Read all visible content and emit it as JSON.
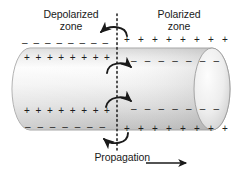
{
  "diagram": {
    "labels": {
      "depolarized_zone": "Depolarized\nzone",
      "polarized_zone": "Polarized\nzone",
      "propagation": "Propagation"
    },
    "colors": {
      "ink": "#1a1a1a",
      "outline": "#9a9a9a",
      "membrane_light": "#fbfbfb",
      "membrane_mid": "#e2e2e2",
      "membrane_dark": "#b9b9b9",
      "background": "#ffffff"
    },
    "charges": {
      "outer_top_left": {
        "sign": "–",
        "count": 8,
        "zone": "depolarized"
      },
      "outer_top_right": {
        "sign": "+",
        "count": 8,
        "zone": "polarized"
      },
      "inner_top_left": {
        "sign": "+",
        "count": 8,
        "zone": "depolarized"
      },
      "inner_top_right": {
        "sign": "–",
        "count": 7,
        "zone": "polarized"
      },
      "inner_bottom_left": {
        "sign": "+",
        "count": 8,
        "zone": "depolarized"
      },
      "inner_bottom_right": {
        "sign": "–",
        "count": 7,
        "zone": "polarized"
      },
      "outer_bottom_left": {
        "sign": "–",
        "count": 7,
        "zone": "depolarized"
      },
      "outer_bottom_right": {
        "sign": "+",
        "count": 8,
        "zone": "polarized"
      }
    },
    "arrows": {
      "count": 4,
      "items": [
        {
          "name": "outer-top-current-arrow",
          "direction": "right-to-left"
        },
        {
          "name": "inner-top-current-arrow",
          "direction": "left-to-right"
        },
        {
          "name": "inner-bottom-current-arrow",
          "direction": "left-to-right"
        },
        {
          "name": "outer-bottom-current-arrow",
          "direction": "right-to-left"
        }
      ]
    },
    "boundary": {
      "style": "dotted",
      "orientation": "vertical"
    },
    "propagation_direction": "right"
  }
}
